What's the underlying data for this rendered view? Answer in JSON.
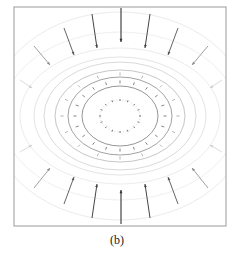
{
  "figure": {
    "caption": "(b)",
    "frame": {
      "x": 14,
      "y": 7,
      "width": 212,
      "height": 219,
      "color": "#9a9a9a"
    },
    "center": {
      "x": 120,
      "y": 116
    },
    "ellipses": [
      {
        "rx": 20,
        "ry": 16,
        "color": "#c8c8c8",
        "dash": "1,2"
      },
      {
        "rx": 38,
        "ry": 30,
        "color": "#7a7a7a"
      },
      {
        "rx": 52,
        "ry": 39,
        "color": "#8a8a8a"
      },
      {
        "rx": 65,
        "ry": 46,
        "color": "#b8b8b8"
      },
      {
        "rx": 76,
        "ry": 54,
        "color": "#cfcfcf"
      },
      {
        "rx": 86,
        "ry": 59,
        "color": "#dcdcdc"
      },
      {
        "rx": 100,
        "ry": 68,
        "color": "#e6e6e6"
      },
      {
        "rx": 118,
        "ry": 84,
        "color": "#ebebeb"
      },
      {
        "rx": 130,
        "ry": 104,
        "color": "#e4e4e4"
      }
    ],
    "arrow_rings": [
      {
        "rx": 20,
        "ry": 16,
        "count": 16,
        "len": 2,
        "color": "#666666"
      },
      {
        "rx": 45,
        "ry": 34,
        "count": 20,
        "len": 3,
        "color": "#777777"
      },
      {
        "rx": 58,
        "ry": 42,
        "count": 16,
        "len": 3,
        "color": "#aaaaaa"
      }
    ],
    "long_arrows": [
      {
        "x1": 121,
        "y1": 8,
        "x2": 121,
        "y2": 42,
        "color": "#333333",
        "width": 1.1
      },
      {
        "x1": 92,
        "y1": 14,
        "x2": 97,
        "y2": 48,
        "color": "#444444",
        "width": 1.0
      },
      {
        "x1": 150,
        "y1": 14,
        "x2": 145,
        "y2": 48,
        "color": "#444444",
        "width": 1.0
      },
      {
        "x1": 64,
        "y1": 28,
        "x2": 74,
        "y2": 55,
        "color": "#555555",
        "width": 0.9
      },
      {
        "x1": 178,
        "y1": 28,
        "x2": 168,
        "y2": 55,
        "color": "#555555",
        "width": 0.9
      },
      {
        "x1": 34,
        "y1": 46,
        "x2": 50,
        "y2": 65,
        "color": "#888888",
        "width": 0.8
      },
      {
        "x1": 208,
        "y1": 46,
        "x2": 192,
        "y2": 65,
        "color": "#888888",
        "width": 0.8
      },
      {
        "x1": 20,
        "y1": 80,
        "x2": 32,
        "y2": 88,
        "color": "#cccccc",
        "width": 0.7
      },
      {
        "x1": 222,
        "y1": 80,
        "x2": 210,
        "y2": 88,
        "color": "#cccccc",
        "width": 0.7
      },
      {
        "x1": 121,
        "y1": 224,
        "x2": 121,
        "y2": 190,
        "color": "#333333",
        "width": 1.1
      },
      {
        "x1": 92,
        "y1": 218,
        "x2": 97,
        "y2": 184,
        "color": "#444444",
        "width": 1.0
      },
      {
        "x1": 150,
        "y1": 218,
        "x2": 145,
        "y2": 184,
        "color": "#444444",
        "width": 1.0
      },
      {
        "x1": 64,
        "y1": 204,
        "x2": 74,
        "y2": 177,
        "color": "#555555",
        "width": 0.9
      },
      {
        "x1": 178,
        "y1": 204,
        "x2": 168,
        "y2": 177,
        "color": "#555555",
        "width": 0.9
      },
      {
        "x1": 34,
        "y1": 188,
        "x2": 50,
        "y2": 168,
        "color": "#888888",
        "width": 0.8
      },
      {
        "x1": 208,
        "y1": 188,
        "x2": 192,
        "y2": 168,
        "color": "#888888",
        "width": 0.8
      },
      {
        "x1": 20,
        "y1": 152,
        "x2": 32,
        "y2": 145,
        "color": "#cccccc",
        "width": 0.7
      },
      {
        "x1": 222,
        "y1": 152,
        "x2": 210,
        "y2": 145,
        "color": "#cccccc",
        "width": 0.7
      }
    ]
  }
}
